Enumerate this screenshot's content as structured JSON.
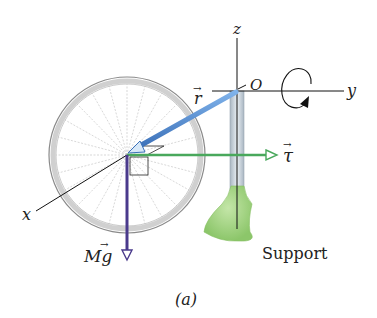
{
  "figure": {
    "caption": "(a)",
    "axes": {
      "x": "x",
      "y": "y",
      "z": "z"
    },
    "origin_label": "O",
    "vectors": {
      "r": {
        "label": "r",
        "color": "#5b8fd6"
      },
      "tau": {
        "label": "τ",
        "color": "#49a85c"
      },
      "Mg": {
        "label": "Mg",
        "color": "#4a3a8c"
      }
    },
    "support_label": "Support",
    "colors": {
      "axis": "#111111",
      "wheel_rim": "#9a9a9a",
      "spokes": "#b5b5b5",
      "support_fill": "#9fd17f",
      "post": "#c9d3dc"
    }
  }
}
